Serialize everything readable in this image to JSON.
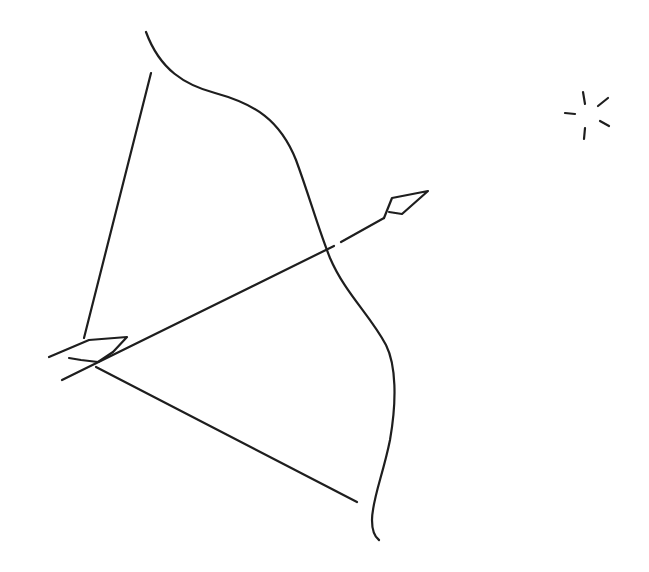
{
  "illustration": {
    "title": "Bow and arrow line drawing",
    "width": 649,
    "height": 572,
    "background": "#ffffff",
    "stroke_color": "#1e1e1e",
    "stroke_width": 2.2,
    "bow": {
      "limb_path": "M146,32 C160,70 185,85 215,93 C255,104 280,120 296,160 C310,198 318,228 330,258 C345,293 370,315 386,345 C396,365 397,400 390,440 C383,475 372,500 372,520 C372,530 375,537 379,540",
      "string_upper": "M151,73 L84,338",
      "string_lower": "M96,367 L357,502"
    },
    "arrow": {
      "shaft": "M62,380 L334,246 M341,242 L384,218",
      "head": "M384,218 L392,198 L428,191 L402,214 L389,212",
      "fletching": "M49,357 L89,340 L127,337 L113,352 L98,362 L81,360 L69,358"
    },
    "sparkle": {
      "rays": [
        "M583,92 L585,104",
        "M598,106 L608,98",
        "M565,113 L575,114",
        "M600,121 L609,126",
        "M585,128 L584,139"
      ]
    }
  }
}
